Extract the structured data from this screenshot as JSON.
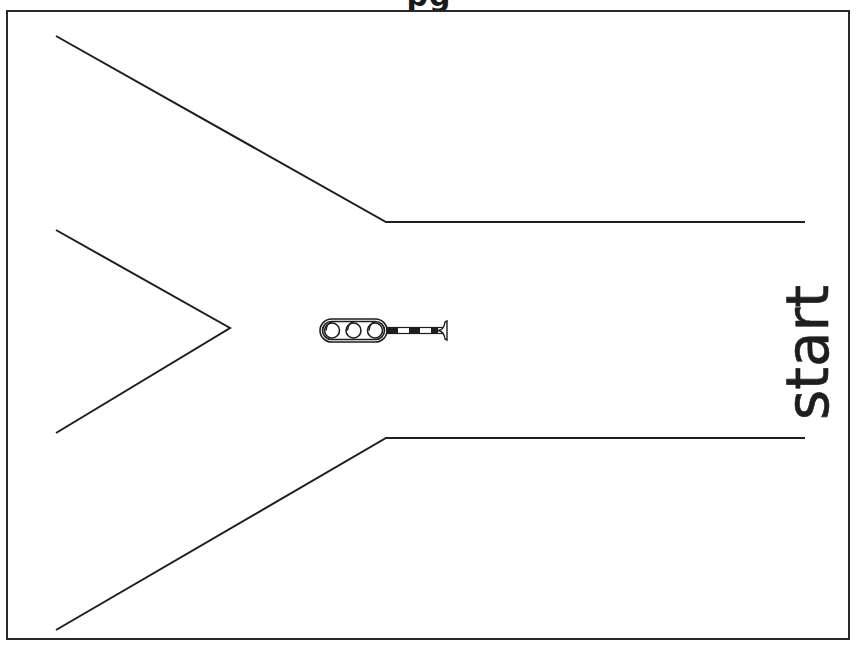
{
  "page": {
    "title_fragment": "pg",
    "label": "start"
  },
  "colors": {
    "ink": "#1e1e1e",
    "background": "#ffffff"
  },
  "road": {
    "outer_upper": [
      [
        56,
        36
      ],
      [
        386,
        222
      ],
      [
        805,
        222
      ]
    ],
    "outer_lower": [
      [
        56,
        630
      ],
      [
        386,
        438
      ],
      [
        805,
        438
      ]
    ],
    "inner_branch": [
      [
        56,
        230
      ],
      [
        230,
        328
      ],
      [
        56,
        433
      ]
    ]
  },
  "traffic_signal": {
    "lamps": 3,
    "position": [
      320,
      330
    ]
  }
}
